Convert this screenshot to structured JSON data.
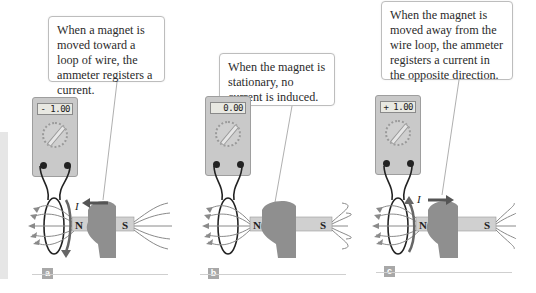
{
  "figure": {
    "panels": [
      {
        "id": "a",
        "label": "a",
        "callout": "When a magnet is moved toward a loop of wire, the ammeter registers a current.",
        "meter_reading": "- 1.00",
        "current_symbol": "I",
        "magnet_motion": "toward loop (arrow pointing left)",
        "north_label": "N",
        "south_label": "S"
      },
      {
        "id": "b",
        "label": "b",
        "callout": "When the magnet is stationary, no current is induced.",
        "meter_reading": "0.00",
        "current_symbol": "",
        "magnet_motion": "stationary",
        "north_label": "N",
        "south_label": "S"
      },
      {
        "id": "c",
        "label": "c",
        "callout": "When the magnet is moved away from the wire loop, the ammeter registers a current in the opposite direction.",
        "meter_reading": "+ 1.00",
        "current_symbol": "I",
        "magnet_motion": "away from loop (arrow pointing right)",
        "north_label": "N",
        "south_label": "S"
      }
    ],
    "colors": {
      "meter_body": "#c9c9c9",
      "field_lines": "#888888",
      "hand": "#8f8f8f",
      "motion_arrow": "#555555",
      "label_box": "#a8a8a8",
      "wire": "#222222"
    }
  }
}
